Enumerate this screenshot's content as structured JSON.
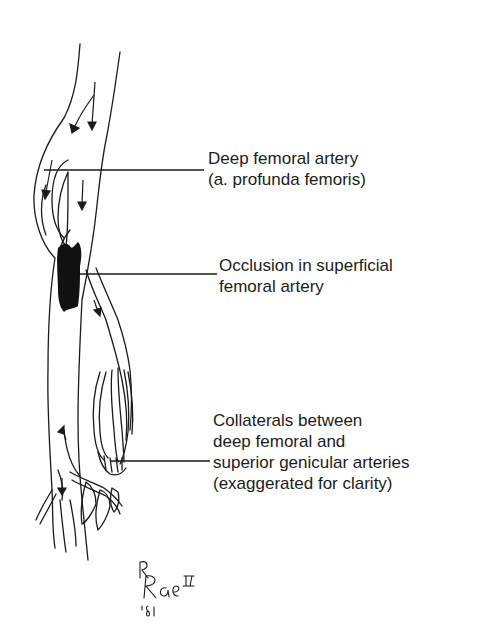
{
  "diagram": {
    "labels": [
      {
        "id": "deep-femoral",
        "lines": [
          "Deep femoral artery",
          "(a. profunda femoris)"
        ]
      },
      {
        "id": "occlusion",
        "lines": [
          "Occlusion in superficial",
          "femoral artery"
        ]
      },
      {
        "id": "collaterals",
        "lines": [
          "Collaterals between",
          "deep femoral and",
          "superior genicular arteries",
          "(exaggerated for clarity)"
        ]
      }
    ],
    "signature": {
      "name": "R Rae II",
      "year": "'81"
    },
    "colors": {
      "ink": "#1a1a1a",
      "background": "#ffffff"
    }
  }
}
